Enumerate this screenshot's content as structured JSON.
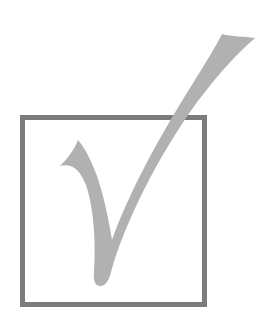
{
  "graphic": {
    "description": "Checkmark in a square box",
    "box": {
      "border_color": "#7c7c7c",
      "fill_color": "#ffffff"
    },
    "checkmark": {
      "color": "#b1b1b1"
    },
    "background_color": "#ffffff"
  }
}
